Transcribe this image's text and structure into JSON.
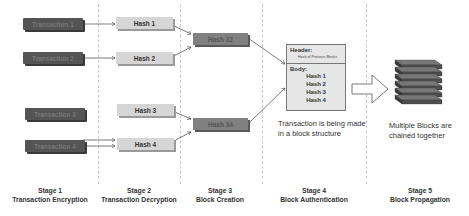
{
  "stage1": {
    "transactions": [
      "Transaction 1",
      "Transaction 2",
      "Transaction 3",
      "Transaction 4"
    ],
    "label": "Stage 1",
    "title": "Transaction Encryption"
  },
  "stage2": {
    "hashes": [
      "Hash 1",
      "Hash 2",
      "Hash 3",
      "Hash 4"
    ],
    "label": "Stage 2",
    "title": "Transaction Decryption"
  },
  "stage3": {
    "hashes": [
      "Hash 12",
      "Hash 34"
    ],
    "label": "Stage 3",
    "title": "Block Creation"
  },
  "stage4": {
    "block": {
      "header_label": "Header:",
      "header_value": "Hash of Previous Blocks",
      "body_label": "Body:",
      "body_items": [
        "Hash 1",
        "Hash 2",
        "Hash 3",
        "Hash 4"
      ]
    },
    "caption_line1": "Transaction is being made",
    "caption_line2": "in a block structure",
    "label": "Stage 4",
    "title": "Block Authentication"
  },
  "stage5": {
    "caption_line1": "Multiple Blocks are",
    "caption_line2": "chained together",
    "label": "Stage 5",
    "title": "Block Propagation"
  },
  "colors": {
    "transaction_box": "#545454",
    "hash_box": "#d6d6d6",
    "combined_hash_box": "#808080",
    "block_fill": "#e6e6e6",
    "stack_block": "#555555"
  }
}
